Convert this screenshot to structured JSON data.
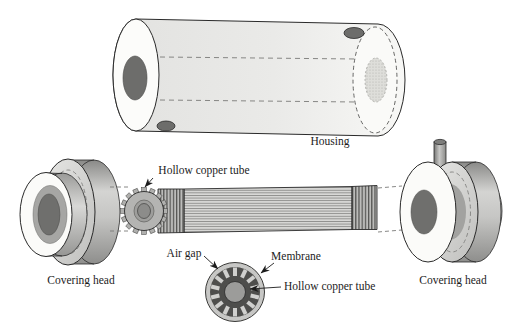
{
  "figure": {
    "labels": {
      "housing": "Housing",
      "hollow_copper_tube_top": "Hollow copper tube",
      "covering_head_left": "Covering head",
      "covering_head_right": "Covering head",
      "air_gap": "Air gap",
      "membrane": "Membrane",
      "hollow_copper_tube_bottom": "Hollow copper tube"
    },
    "palette": {
      "background": "#ffffff",
      "outline": "#2a2a2a",
      "housing_body_gray": "#e8e8e6",
      "dark_hole_gray": "#6d6d6b",
      "disc_face_gray": "#d2d2d0",
      "cross_section_dark": "#4e4e4c",
      "cross_section_ring": "#c7c7c5",
      "copper_tube_center": "#9c9c9a"
    }
  }
}
